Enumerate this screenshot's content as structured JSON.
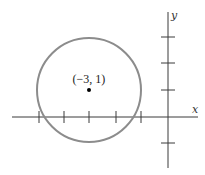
{
  "diagram": {
    "type": "coordinate-plane-circle",
    "x_axis_label": "x",
    "y_axis_label": "y",
    "center_label": "(−3, 1)",
    "center": {
      "x": -3,
      "y": 1
    },
    "radius": 2,
    "x_ticks": [
      -5,
      -4,
      -3,
      -2,
      -1
    ],
    "y_ticks": [
      -1,
      1,
      2,
      3
    ],
    "colors": {
      "axis": "#3a3a3a",
      "circle": "#8c8c8c",
      "point": "#000000"
    }
  }
}
